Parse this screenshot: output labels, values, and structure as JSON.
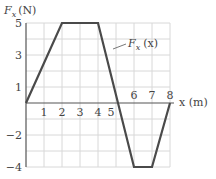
{
  "chart_data": {
    "type": "line",
    "title": "",
    "xlabel": "x (m)",
    "ylabel_main": "F",
    "ylabel_sub": "x",
    "ylabel_unit": "(N)",
    "series": [
      {
        "name": "F_x (x)",
        "label_main": "F",
        "label_sub": "x",
        "label_arg": "(x)",
        "x": [
          0,
          2,
          4,
          6,
          7,
          8
        ],
        "y": [
          0,
          5,
          5,
          -4,
          -4,
          0
        ]
      }
    ],
    "xlim": [
      0,
      8
    ],
    "ylim": [
      -4,
      5
    ],
    "x_ticks": [
      {
        "value": 1,
        "label": "1"
      },
      {
        "value": 2,
        "label": "2"
      },
      {
        "value": 3,
        "label": "3"
      },
      {
        "value": 4,
        "label": "4"
      },
      {
        "value": 5,
        "label": "5"
      },
      {
        "value": 6,
        "label": "6"
      },
      {
        "value": 7,
        "label": "7"
      },
      {
        "value": 8,
        "label": "8"
      }
    ],
    "y_ticks": [
      {
        "value": 5,
        "label": "5"
      },
      {
        "value": 3,
        "label": "3"
      },
      {
        "value": 1,
        "label": "1"
      },
      {
        "value": -2,
        "label": "−2"
      },
      {
        "value": -4,
        "label": "−4"
      }
    ],
    "grid": true,
    "legend": "inline-annotation"
  },
  "colors": {
    "line": "#4a4a4a",
    "axis": "#555555",
    "grid": "#d8d8d8"
  }
}
